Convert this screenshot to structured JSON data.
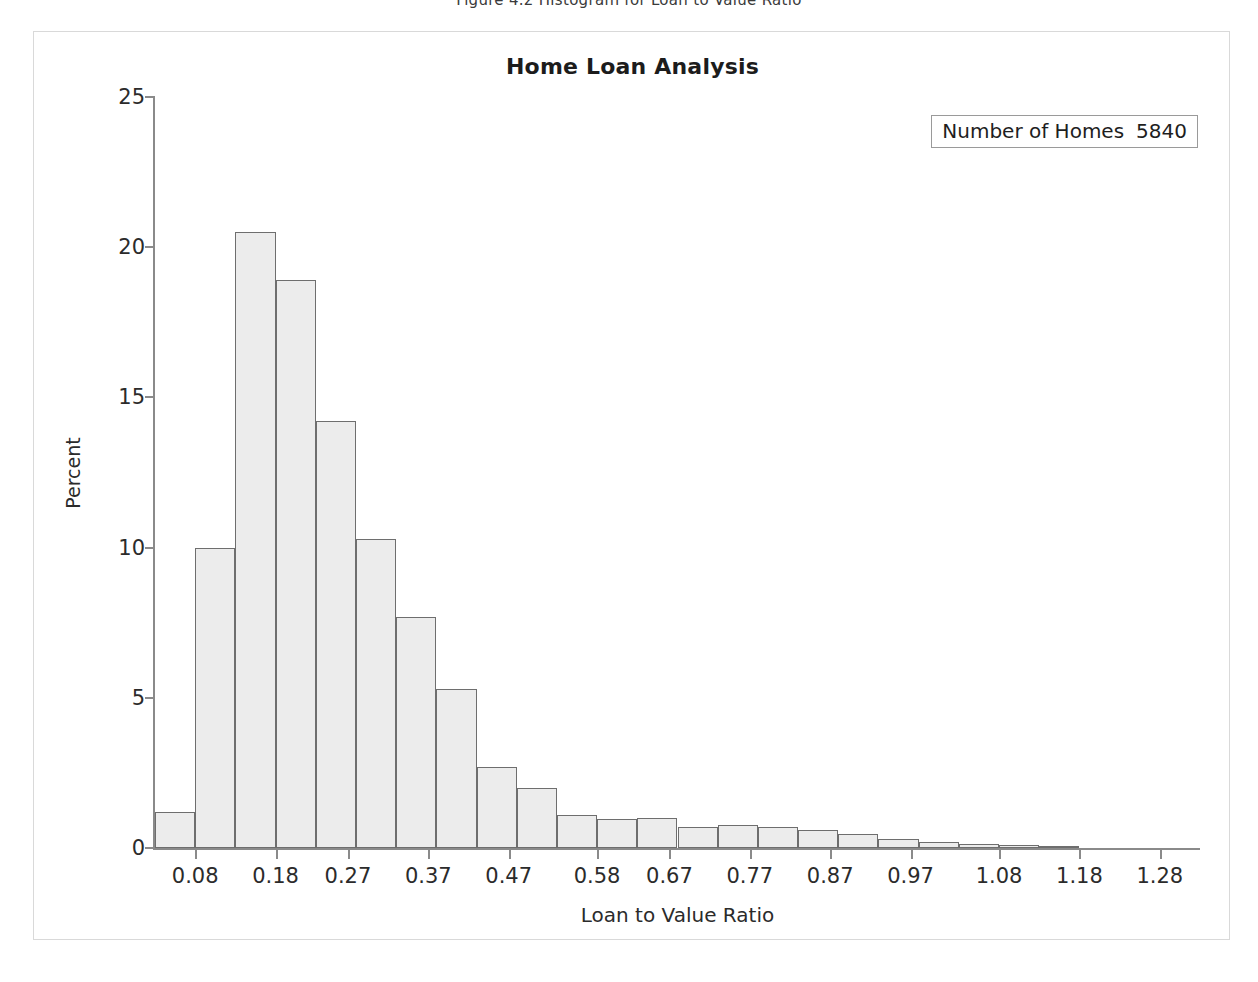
{
  "figure": {
    "caption": "Figure 4.2 Histogram for Loan to Value Ratio"
  },
  "chart_data": {
    "type": "bar",
    "title": "Home Loan Analysis",
    "xlabel": "Loan to Value Ratio",
    "ylabel": "Percent",
    "ylim": [
      0,
      25
    ],
    "xlim": [
      0.03,
      1.33
    ],
    "grid": false,
    "legend_position": "top-right",
    "annotations": [
      {
        "label": "Number of Homes",
        "value": "5840"
      }
    ],
    "ytick_labels": [
      "0",
      "5",
      "10",
      "15",
      "20",
      "25"
    ],
    "ytick_values": [
      0,
      5,
      10,
      15,
      20,
      25
    ],
    "xtick_labels": [
      "0.08",
      "0.18",
      "0.27",
      "0.37",
      "0.47",
      "0.58",
      "0.67",
      "0.77",
      "0.87",
      "0.97",
      "1.08",
      "1.18",
      "1.28"
    ],
    "xtick_values": [
      0.08,
      0.18,
      0.27,
      0.37,
      0.47,
      0.58,
      0.67,
      0.77,
      0.87,
      0.97,
      1.08,
      1.18,
      1.28
    ],
    "bin_width": 0.05,
    "bin_centers": [
      0.055,
      0.105,
      0.155,
      0.205,
      0.255,
      0.305,
      0.355,
      0.405,
      0.455,
      0.505,
      0.555,
      0.605,
      0.655,
      0.705,
      0.755,
      0.805,
      0.855,
      0.905,
      0.955,
      1.005,
      1.055,
      1.105,
      1.155,
      1.205,
      1.255,
      1.305
    ],
    "categories": [
      "0.055",
      "0.105",
      "0.155",
      "0.205",
      "0.255",
      "0.305",
      "0.355",
      "0.405",
      "0.455",
      "0.505",
      "0.555",
      "0.605",
      "0.655",
      "0.705",
      "0.755",
      "0.805",
      "0.855",
      "0.905",
      "0.955",
      "1.005",
      "1.055",
      "1.105",
      "1.155",
      "1.205",
      "1.255",
      "1.305"
    ],
    "values": [
      1.2,
      10.0,
      20.5,
      18.9,
      14.2,
      10.3,
      7.7,
      5.3,
      2.7,
      2.0,
      1.1,
      0.95,
      1.0,
      0.7,
      0.75,
      0.7,
      0.6,
      0.45,
      0.3,
      0.2,
      0.15,
      0.1,
      0.05,
      0.0,
      0.0,
      0.0
    ],
    "bar_fill": "#ececec",
    "bar_edge": "#6e6e6e",
    "axis_color": "#8a8a8a",
    "text_color": "#2b2b2b"
  }
}
